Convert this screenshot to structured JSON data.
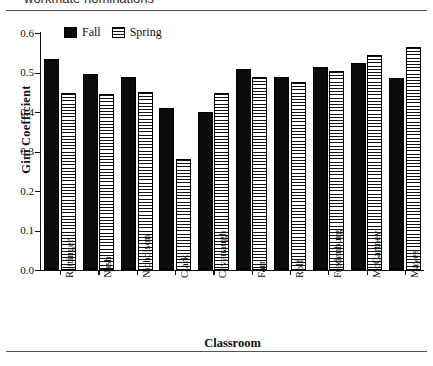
{
  "caption": {
    "text": "workmate nominations"
  },
  "legend": {
    "position": "top-left-inside",
    "items": [
      {
        "label": "Fall",
        "pattern": "solid-black"
      },
      {
        "label": "Spring",
        "pattern": "horizontal-hatch"
      }
    ]
  },
  "axes": {
    "ytitle": "Gini Coefficient",
    "xtitle": "Classroom",
    "yticks": [
      "0.0",
      "0.1",
      "0.2",
      "0.3",
      "0.4",
      "0.5",
      "0.6"
    ]
  },
  "chart_data": {
    "type": "bar",
    "title": "",
    "subtitle": "",
    "xlabel": "Classroom",
    "ylabel": "Gini Coefficient",
    "ylim": [
      0.0,
      0.6
    ],
    "ytick_values": [
      0.0,
      0.1,
      0.2,
      0.3,
      0.4,
      0.5,
      0.6
    ],
    "grid": false,
    "legend_position": "upper left",
    "categories": [
      "Rettinger",
      "Nash",
      "Nicholson",
      "Clark",
      "Cavanaugh",
      "Farr",
      "Rolf",
      "Fredenburg",
      "McCartney",
      "Mayes"
    ],
    "series": [
      {
        "name": "Fall",
        "values": [
          0.535,
          0.497,
          0.489,
          0.411,
          0.401,
          0.508,
          0.489,
          0.514,
          0.524,
          0.487
        ]
      },
      {
        "name": "Spring",
        "values": [
          0.447,
          0.446,
          0.45,
          0.28,
          0.448,
          0.489,
          0.475,
          0.505,
          0.545,
          0.565
        ]
      }
    ]
  }
}
